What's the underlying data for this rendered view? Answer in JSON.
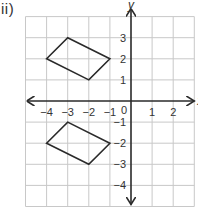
{
  "problem_label": "ii)",
  "diagram": {
    "type": "coordinate-grid",
    "x_range": [
      -5,
      3
    ],
    "y_range": [
      -5,
      4
    ],
    "axis_labels": {
      "y": "y",
      "x": "x"
    },
    "x_ticks": [
      {
        "value": -4,
        "label": "−4"
      },
      {
        "value": -3,
        "label": "−3"
      },
      {
        "value": -2,
        "label": "−2"
      },
      {
        "value": -1,
        "label": "−1"
      },
      {
        "value": 1,
        "label": "1"
      },
      {
        "value": 2,
        "label": "2"
      }
    ],
    "y_ticks": [
      {
        "value": 3,
        "label": "3"
      },
      {
        "value": 2,
        "label": "2"
      },
      {
        "value": 1,
        "label": "1"
      },
      {
        "value": -1,
        "label": "−1"
      },
      {
        "value": -2,
        "label": "−2"
      },
      {
        "value": -3,
        "label": "−3"
      },
      {
        "value": -4,
        "label": "−4"
      }
    ],
    "origin_label": "0",
    "shapes": [
      {
        "name": "upper-parallelogram",
        "vertices": [
          [
            -4,
            2
          ],
          [
            -3,
            3
          ],
          [
            -1,
            2
          ],
          [
            -2,
            1
          ]
        ]
      },
      {
        "name": "lower-parallelogram",
        "vertices": [
          [
            -4,
            -2
          ],
          [
            -3,
            -1
          ],
          [
            -1,
            -2
          ],
          [
            -2,
            -3
          ]
        ]
      }
    ]
  }
}
